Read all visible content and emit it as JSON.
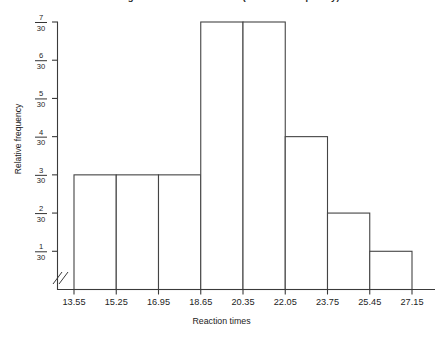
{
  "chart_data": {
    "type": "bar",
    "title": "Histogram of Reaction Times (Relative Frequency)",
    "xlabel": "Reaction times",
    "ylabel": "Relative frequency",
    "categories": [
      "13.55-15.25",
      "15.25-16.95",
      "16.95-18.65",
      "18.65-20.35",
      "20.35-22.05",
      "22.05-23.75",
      "23.75-25.45",
      "25.45-27.15"
    ],
    "values": [
      3,
      3,
      3,
      7,
      7,
      4,
      2,
      1
    ],
    "value_labels": [
      "3/30",
      "3/30",
      "3/30",
      "7/30",
      "7/30",
      "4/30",
      "2/30",
      "1/30"
    ],
    "denominator": 30,
    "bin_width": 1.7,
    "bin_edges": [
      13.55,
      15.25,
      16.95,
      18.65,
      20.35,
      22.05,
      23.75,
      25.45,
      27.15
    ],
    "xticks": [
      "13.55",
      "15.25",
      "16.95",
      "18.65",
      "20.35",
      "22.05",
      "23.75",
      "25.45",
      "27.15"
    ],
    "xlim": [
      13.55,
      27.15
    ],
    "yticks": [
      {
        "num": "1",
        "den": "30",
        "value": 1
      },
      {
        "num": "2",
        "den": "30",
        "value": 2
      },
      {
        "num": "3",
        "den": "30",
        "value": 3
      },
      {
        "num": "4",
        "den": "30",
        "value": 4
      },
      {
        "num": "5",
        "den": "30",
        "value": 5
      },
      {
        "num": "6",
        "den": "30",
        "value": 6
      },
      {
        "num": "7",
        "den": "30",
        "value": 7
      }
    ],
    "ylim": [
      0,
      7
    ],
    "grid": false,
    "legend": false,
    "axis_break": true,
    "bar_fill_color": "#ffffff",
    "bar_edge_color": "#444444",
    "axis_color": "#3a3a3a",
    "background_color": "#ffffff"
  }
}
